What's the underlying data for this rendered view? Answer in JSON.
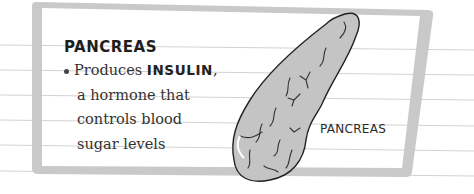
{
  "section": {
    "heading": "PANCREAS",
    "bullet": {
      "prefix": "Produces ",
      "keyword": "INSULIN",
      "suffix": ",",
      "lines": [
        "a hormone that",
        "controls blood",
        "sugar levels"
      ]
    }
  },
  "illustration": {
    "icon": "pancreas-organ-illustration",
    "label": "PANCREAS"
  },
  "colors": {
    "frame": "#c8c8c8",
    "ruled_line": "#cfcfcf",
    "organ_fill": "#c4c4c4",
    "text": "#2b2b2b"
  }
}
